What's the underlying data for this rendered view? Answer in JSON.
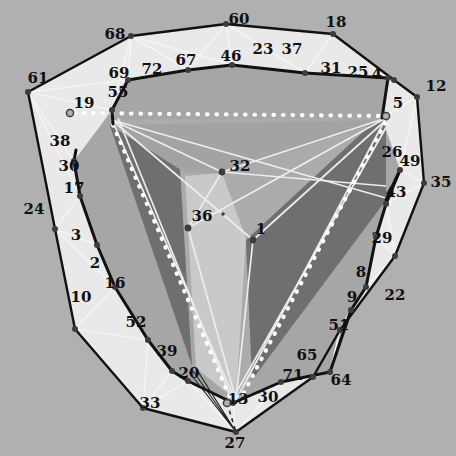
{
  "figure": {
    "kind": "polygon-triangulation-diagram",
    "width": 456,
    "height": 456,
    "background_color": "#b0b0b0",
    "outline_color": "#111111",
    "edge_color": "#f2f2f2",
    "fill_light": "#e8e8e8",
    "fill_mid": "#a0a0a0",
    "fill_dark": "#6b6b6b",
    "dot_color": "#ffffff",
    "vertex_color": "#3a3a3a",
    "open_marker_fill": "#b0b0b0"
  },
  "labels": [
    {
      "id": "60",
      "x": 239,
      "y": 19
    },
    {
      "id": "18",
      "x": 336,
      "y": 22
    },
    {
      "id": "68",
      "x": 115,
      "y": 34
    },
    {
      "id": "23",
      "x": 263,
      "y": 49
    },
    {
      "id": "37",
      "x": 292,
      "y": 49
    },
    {
      "id": "46",
      "x": 231,
      "y": 56
    },
    {
      "id": "67",
      "x": 186,
      "y": 60
    },
    {
      "id": "72",
      "x": 152,
      "y": 69
    },
    {
      "id": "31",
      "x": 331,
      "y": 68
    },
    {
      "id": "25",
      "x": 358,
      "y": 72
    },
    {
      "id": "4",
      "x": 377,
      "y": 74
    },
    {
      "id": "61",
      "x": 38,
      "y": 78
    },
    {
      "id": "69",
      "x": 119,
      "y": 73
    },
    {
      "id": "12",
      "x": 436,
      "y": 86
    },
    {
      "id": "55",
      "x": 118,
      "y": 92
    },
    {
      "id": "19",
      "x": 84,
      "y": 103
    },
    {
      "id": "5",
      "x": 398,
      "y": 103
    },
    {
      "id": "26",
      "x": 392,
      "y": 152
    },
    {
      "id": "49",
      "x": 410,
      "y": 161
    },
    {
      "id": "38",
      "x": 60,
      "y": 141
    },
    {
      "id": "35",
      "x": 441,
      "y": 182
    },
    {
      "id": "32",
      "x": 240,
      "y": 166
    },
    {
      "id": "30",
      "x": 69,
      "y": 166
    },
    {
      "id": "43",
      "x": 396,
      "y": 192
    },
    {
      "id": "17",
      "x": 74,
      "y": 188
    },
    {
      "id": "24",
      "x": 34,
      "y": 209
    },
    {
      "id": "36",
      "x": 202,
      "y": 216
    },
    {
      "id": "1",
      "x": 261,
      "y": 229
    },
    {
      "id": "29",
      "x": 382,
      "y": 238
    },
    {
      "id": "3",
      "x": 76,
      "y": 235
    },
    {
      "id": "2",
      "x": 95,
      "y": 263
    },
    {
      "id": "8",
      "x": 361,
      "y": 272
    },
    {
      "id": "16",
      "x": 115,
      "y": 283
    },
    {
      "id": "9",
      "x": 352,
      "y": 297
    },
    {
      "id": "22",
      "x": 395,
      "y": 295
    },
    {
      "id": "10",
      "x": 81,
      "y": 297
    },
    {
      "id": "52",
      "x": 136,
      "y": 322
    },
    {
      "id": "51",
      "x": 339,
      "y": 325
    },
    {
      "id": "39",
      "x": 167,
      "y": 351
    },
    {
      "id": "65",
      "x": 307,
      "y": 355
    },
    {
      "id": "71",
      "x": 293,
      "y": 375
    },
    {
      "id": "20",
      "x": 189,
      "y": 373
    },
    {
      "id": "64",
      "x": 341,
      "y": 380
    },
    {
      "id": "33",
      "x": 150,
      "y": 403
    },
    {
      "id": "13",
      "x": 238,
      "y": 399
    },
    {
      "id": "30b",
      "x": 268,
      "y": 397
    },
    {
      "id": "27",
      "x": 235,
      "y": 443
    }
  ],
  "label_texts": {
    "30b": "30"
  },
  "outer_polygon": [
    [
      226,
      24
    ],
    [
      333,
      34
    ],
    [
      394,
      80
    ],
    [
      417,
      97
    ],
    [
      424,
      183
    ],
    [
      395,
      256
    ],
    [
      340,
      330
    ],
    [
      313,
      377
    ],
    [
      236,
      432
    ],
    [
      143,
      408
    ],
    [
      75,
      329
    ],
    [
      55,
      229
    ],
    [
      28,
      92
    ],
    [
      131,
      36
    ]
  ],
  "inner_ring": [
    [
      232,
      65
    ],
    [
      305,
      73
    ],
    [
      388,
      78
    ],
    [
      382,
      118
    ],
    [
      400,
      170
    ],
    [
      386,
      204
    ],
    [
      376,
      237
    ],
    [
      366,
      287
    ],
    [
      351,
      310
    ],
    [
      330,
      372
    ],
    [
      281,
      382
    ],
    [
      233,
      403
    ],
    [
      188,
      381
    ],
    [
      172,
      371
    ],
    [
      148,
      340
    ],
    [
      115,
      287
    ],
    [
      97,
      245
    ],
    [
      80,
      196
    ],
    [
      74,
      161
    ],
    [
      112,
      110
    ],
    [
      128,
      80
    ],
    [
      188,
      70
    ]
  ],
  "central_triangle": [
    [
      108,
      120
    ],
    [
      388,
      117
    ],
    [
      236,
      402
    ]
  ],
  "dark_wedges": [
    [
      [
        112,
        122
      ],
      [
        178,
        170
      ],
      [
        190,
        367
      ],
      [
        108,
        126
      ]
    ],
    [
      [
        385,
        120
      ],
      [
        386,
        200
      ],
      [
        250,
        378
      ],
      [
        238,
        240
      ]
    ],
    [
      [
        246,
        238
      ],
      [
        374,
        120
      ],
      [
        388,
        119
      ],
      [
        252,
        380
      ]
    ]
  ],
  "interior_nodes": [
    {
      "name": "node-32",
      "x": 222,
      "y": 172
    },
    {
      "name": "node-36",
      "x": 188,
      "y": 228
    },
    {
      "name": "node-1",
      "x": 253,
      "y": 240
    },
    {
      "name": "centroid",
      "x": 223,
      "y": 214
    }
  ],
  "open_markers": [
    {
      "name": "open-marker-19",
      "x": 70,
      "y": 113
    },
    {
      "name": "open-marker-5",
      "x": 386,
      "y": 116
    },
    {
      "name": "open-marker-13",
      "x": 227,
      "y": 403
    }
  ],
  "caption": ""
}
